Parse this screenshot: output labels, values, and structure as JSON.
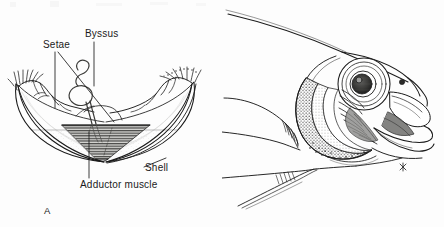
{
  "figure": {
    "type": "scientific-line-illustration",
    "background_color": "#fdfdfd",
    "ink_color": "#1b1b1b",
    "panels": [
      {
        "letter": "A",
        "subject": "bivalve mussel with open shell valves",
        "labels": [
          {
            "text": "Setae",
            "name": "setae"
          },
          {
            "text": "Byssus",
            "name": "byssus"
          },
          {
            "text": "Shell",
            "name": "shell"
          },
          {
            "text": "Adductor muscle",
            "name": "adductor-muscle"
          }
        ]
      },
      {
        "letter": "B",
        "subject": "fish head in profile with gill arch exposed",
        "labels": []
      }
    ]
  },
  "labels": {
    "setae": "Setae",
    "byssus": "Byssus",
    "shell": "Shell",
    "adductor_muscle": "Adductor muscle"
  },
  "panel_letters": {
    "a": "A",
    "b": "B"
  },
  "icons": {
    "mussel": "mussel-illustration",
    "fish_head": "fish-head-illustration"
  }
}
